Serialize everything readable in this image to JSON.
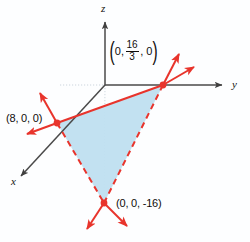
{
  "figure": {
    "background_color": "#fdfeff",
    "axes": {
      "x_label": "x",
      "y_label": "y",
      "z_label": "z",
      "axis_color": "#4a4a4a",
      "origin": {
        "x": 105,
        "y": 85
      }
    },
    "plane": {
      "fill_color": "#bfdff0",
      "edge_color": "#e8342c",
      "solid_edge": "top",
      "dashed_edges": "lower-left and lower-right"
    },
    "intercepts": [
      {
        "name": "x-intercept",
        "label": "(8, 0, 0)",
        "point": {
          "x": 57,
          "y": 123
        },
        "label_pos": {
          "x": 6,
          "y": 113
        }
      },
      {
        "name": "y-intercept",
        "label_parts": {
          "open": "(",
          "first": "0,",
          "numerator": "16",
          "denominator": "3",
          "last": ", 0",
          "close": ")"
        },
        "label_plain": "(0, 16/3, 0)",
        "point": {
          "x": 163,
          "y": 85
        },
        "label_pos": {
          "x": 110,
          "y": 40
        }
      },
      {
        "name": "z-intercept",
        "label": "(0, 0, -16)",
        "point": {
          "x": 104,
          "y": 203
        },
        "label_pos": {
          "x": 116,
          "y": 198
        }
      }
    ],
    "vertex_marker_color": "#e8342c",
    "arrow_color": "#e8342c",
    "guide_line_color": "#cfd6dd"
  }
}
